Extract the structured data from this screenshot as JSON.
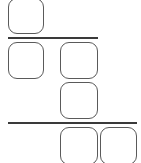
{
  "diagram": {
    "colors": {
      "stroke": "#5a5a5a",
      "line": "#3a3a3a",
      "background": "#ffffff"
    },
    "rows": [
      {
        "name": "row-1",
        "boxes": [
          {
            "id": "box-a",
            "x": 8,
            "y": -2,
            "w": 36,
            "h": 36
          }
        ]
      },
      {
        "name": "divider-1",
        "line": {
          "x": 8,
          "y": 37,
          "w": 90
        }
      },
      {
        "name": "row-2",
        "boxes": [
          {
            "id": "box-b",
            "x": 8,
            "y": 42,
            "w": 36,
            "h": 37
          },
          {
            "id": "box-c",
            "x": 60,
            "y": 42,
            "w": 38,
            "h": 37
          }
        ]
      },
      {
        "name": "row-3",
        "boxes": [
          {
            "id": "box-d",
            "x": 60,
            "y": 82,
            "w": 38,
            "h": 37
          }
        ]
      },
      {
        "name": "divider-2",
        "line": {
          "x": 8,
          "y": 122,
          "w": 129
        }
      },
      {
        "name": "row-4",
        "boxes": [
          {
            "id": "box-e",
            "x": 60,
            "y": 127,
            "w": 38,
            "h": 38
          },
          {
            "id": "box-f",
            "x": 100,
            "y": 127,
            "w": 37,
            "h": 38
          }
        ]
      }
    ]
  }
}
